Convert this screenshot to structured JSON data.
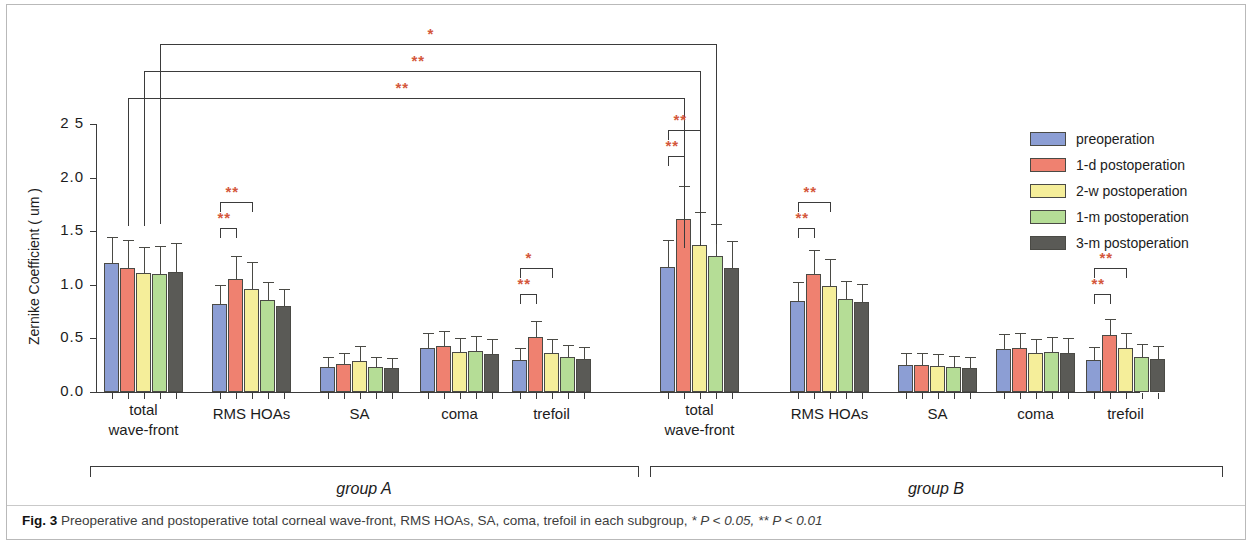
{
  "figure": {
    "label": "Fig. 3",
    "caption_text": " Preoperative and postoperative total corneal wave-front, RMS HOAs, SA, coma, trefoil in each subgroup, ",
    "caption_sig1": "* P < 0.05,",
    "caption_sig2": " ** P < 0.01"
  },
  "legend": {
    "items": [
      {
        "label": "preoperation",
        "color": "#8c9ed4"
      },
      {
        "label": "1-d postoperation",
        "color": "#ef8170"
      },
      {
        "label": "2-w postoperation",
        "color": "#f5ee9a"
      },
      {
        "label": "1-m postoperation",
        "color": "#b5dd96"
      },
      {
        "label": "3-m postoperation",
        "color": "#5a5a56"
      }
    ]
  },
  "groups": [
    {
      "name": "group A"
    },
    {
      "name": "group B"
    }
  ],
  "significance": {
    "one_star": "*",
    "two_star": "**"
  },
  "chart_data": {
    "type": "bar",
    "title": "",
    "xlabel": "",
    "ylabel": "Zernike Coefficient ( um )",
    "ylim": [
      0.0,
      2.5
    ],
    "ytick_labels": [
      "0.0",
      "0.5",
      "1.0",
      "1.5",
      "2.0",
      "2 5"
    ],
    "ytick_values": [
      0.0,
      0.5,
      1.0,
      1.5,
      2.0,
      2.5
    ],
    "grid": false,
    "legend_position": "right",
    "series_names": [
      "preoperation",
      "1-d postoperation",
      "2-w postoperation",
      "1-m postoperation",
      "3-m postoperation"
    ],
    "categories": [
      "total\nwave-front",
      "RMS HOAs",
      "SA",
      "coma",
      "trefoil",
      "total\nwave-front",
      "RMS HOAs",
      "SA",
      "coma",
      "trefoil"
    ],
    "group_of_category": [
      "group A",
      "group A",
      "group A",
      "group A",
      "group A",
      "group B",
      "group B",
      "group B",
      "group B",
      "group B"
    ],
    "clusters": [
      {
        "category": "total wave-front",
        "group": "group A",
        "values": [
          1.2,
          1.16,
          1.11,
          1.1,
          1.12
        ],
        "errors": [
          0.25,
          0.26,
          0.24,
          0.26,
          0.27
        ]
      },
      {
        "category": "RMS HOAs",
        "group": "group A",
        "values": [
          0.82,
          1.05,
          0.96,
          0.86,
          0.8
        ],
        "errors": [
          0.18,
          0.22,
          0.25,
          0.17,
          0.16
        ]
      },
      {
        "category": "SA",
        "group": "group A",
        "values": [
          0.23,
          0.26,
          0.29,
          0.23,
          0.22
        ],
        "errors": [
          0.1,
          0.1,
          0.14,
          0.1,
          0.1
        ]
      },
      {
        "category": "coma",
        "group": "group A",
        "values": [
          0.41,
          0.43,
          0.37,
          0.38,
          0.35
        ],
        "errors": [
          0.14,
          0.14,
          0.13,
          0.14,
          0.14
        ]
      },
      {
        "category": "trefoil",
        "group": "group A",
        "values": [
          0.3,
          0.51,
          0.36,
          0.33,
          0.31
        ],
        "errors": [
          0.11,
          0.15,
          0.13,
          0.11,
          0.11
        ]
      },
      {
        "category": "total wave-front",
        "group": "group B",
        "values": [
          1.17,
          1.61,
          1.37,
          1.27,
          1.16
        ],
        "errors": [
          0.25,
          0.31,
          0.31,
          0.3,
          0.25
        ]
      },
      {
        "category": "RMS HOAs",
        "group": "group B",
        "values": [
          0.85,
          1.1,
          0.99,
          0.87,
          0.84
        ],
        "errors": [
          0.18,
          0.22,
          0.25,
          0.17,
          0.17
        ]
      },
      {
        "category": "SA",
        "group": "group B",
        "values": [
          0.25,
          0.25,
          0.24,
          0.23,
          0.22
        ],
        "errors": [
          0.11,
          0.11,
          0.11,
          0.11,
          0.11
        ]
      },
      {
        "category": "coma",
        "group": "group B",
        "values": [
          0.4,
          0.41,
          0.36,
          0.37,
          0.36
        ],
        "errors": [
          0.14,
          0.14,
          0.13,
          0.14,
          0.14
        ]
      },
      {
        "category": "trefoil",
        "group": "group B",
        "values": [
          0.3,
          0.53,
          0.41,
          0.33,
          0.31
        ],
        "errors": [
          0.12,
          0.15,
          0.14,
          0.12,
          0.12
        ]
      }
    ],
    "annotations": [
      {
        "id": "interA-1",
        "mark": "*",
        "from": "A total wave-front 1-m",
        "to": "B total wave-front 1-m"
      },
      {
        "id": "interA-2",
        "mark": "**",
        "from": "A total wave-front 2-w",
        "to": "B total wave-front 2-w"
      },
      {
        "id": "interA-3",
        "mark": "**",
        "from": "A total wave-front 1-d",
        "to": "B total wave-front 1-d"
      },
      {
        "id": "A-rms-inner",
        "mark": "**",
        "from": "A RMS HOAs preop",
        "to": "A RMS HOAs 1-d"
      },
      {
        "id": "A-rms-outer",
        "mark": "**",
        "from": "A RMS HOAs preop",
        "to": "A RMS HOAs 2-w"
      },
      {
        "id": "A-tref-inner",
        "mark": "**",
        "from": "A trefoil preop",
        "to": "A trefoil 1-d"
      },
      {
        "id": "A-tref-outer",
        "mark": "*",
        "from": "A trefoil preop",
        "to": "A trefoil 2-w"
      },
      {
        "id": "B-twf-inner",
        "mark": "**",
        "from": "B total wave-front preop",
        "to": "B total wave-front 1-d"
      },
      {
        "id": "B-twf-outer",
        "mark": "**",
        "from": "B total wave-front preop",
        "to": "B total wave-front 2-w"
      },
      {
        "id": "B-rms-inner",
        "mark": "**",
        "from": "B RMS HOAs preop",
        "to": "B RMS HOAs 1-d"
      },
      {
        "id": "B-rms-outer",
        "mark": "**",
        "from": "B RMS HOAs preop",
        "to": "B RMS HOAs 2-w"
      },
      {
        "id": "B-tref-inner",
        "mark": "**",
        "from": "B trefoil preop",
        "to": "B trefoil 1-d"
      },
      {
        "id": "B-tref-outer",
        "mark": "**",
        "from": "B trefoil preop",
        "to": "B trefoil 2-w"
      }
    ]
  }
}
